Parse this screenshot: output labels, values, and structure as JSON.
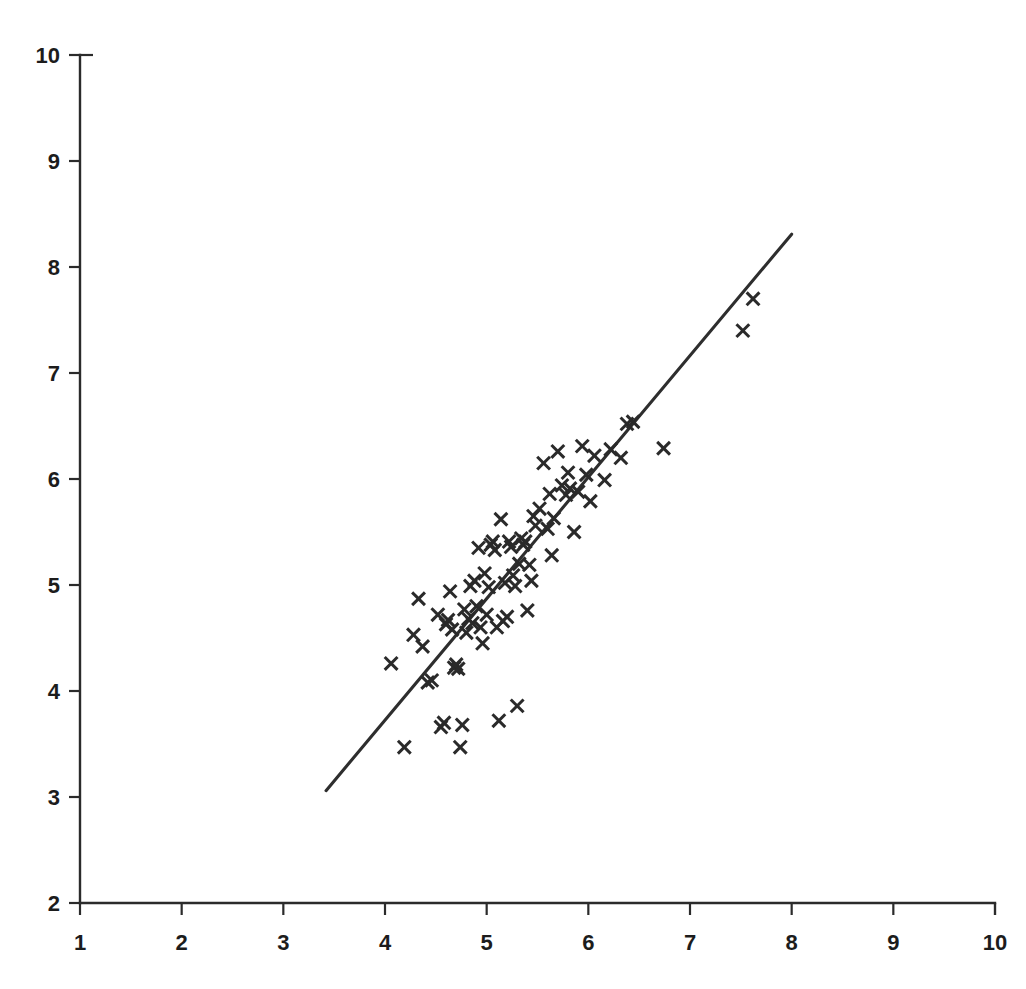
{
  "chart_data": {
    "type": "scatter",
    "title": "",
    "subtitle": "",
    "xlabel": "",
    "ylabel": "",
    "xlim": [
      1,
      10
    ],
    "ylim": [
      2,
      10
    ],
    "xticks": [
      1,
      2,
      3,
      4,
      5,
      6,
      7,
      8,
      9,
      10
    ],
    "yticks": [
      2,
      3,
      4,
      5,
      6,
      7,
      8,
      9,
      10
    ],
    "xtick_labels": [
      "1",
      "2",
      "3",
      "4",
      "5",
      "6",
      "7",
      "8",
      "9",
      "10"
    ],
    "ytick_labels": [
      "2",
      "3",
      "4",
      "5",
      "6",
      "7",
      "8",
      "9",
      "10"
    ],
    "grid": false,
    "legend": null,
    "marker": "x",
    "marker_color": "#2a2a2a",
    "line_color": "#2e2e2e",
    "axis_color": "#2b2b2b",
    "background_color": "#ffffff",
    "annotations": [],
    "series": [
      {
        "name": "observations",
        "type": "scatter",
        "points": [
          [
            4.06,
            4.26
          ],
          [
            4.19,
            3.47
          ],
          [
            4.28,
            4.53
          ],
          [
            4.33,
            4.87
          ],
          [
            4.37,
            4.42
          ],
          [
            4.42,
            4.08
          ],
          [
            4.46,
            4.1
          ],
          [
            4.52,
            4.72
          ],
          [
            4.55,
            3.66
          ],
          [
            4.58,
            3.7
          ],
          [
            4.6,
            4.63
          ],
          [
            4.62,
            4.67
          ],
          [
            4.64,
            4.94
          ],
          [
            4.66,
            4.58
          ],
          [
            4.68,
            4.22
          ],
          [
            4.7,
            4.25
          ],
          [
            4.72,
            4.21
          ],
          [
            4.74,
            3.47
          ],
          [
            4.76,
            3.68
          ],
          [
            4.78,
            4.77
          ],
          [
            4.8,
            4.55
          ],
          [
            4.82,
            4.68
          ],
          [
            4.84,
            4.99
          ],
          [
            4.86,
            4.64
          ],
          [
            4.88,
            5.04
          ],
          [
            4.9,
            4.8
          ],
          [
            4.92,
            5.35
          ],
          [
            4.94,
            4.6
          ],
          [
            4.96,
            4.45
          ],
          [
            4.98,
            5.11
          ],
          [
            5.0,
            4.72
          ],
          [
            5.02,
            4.98
          ],
          [
            5.04,
            5.38
          ],
          [
            5.06,
            5.41
          ],
          [
            5.08,
            5.33
          ],
          [
            5.1,
            4.6
          ],
          [
            5.12,
            3.72
          ],
          [
            5.14,
            5.62
          ],
          [
            5.16,
            4.66
          ],
          [
            5.18,
            5.02
          ],
          [
            5.2,
            4.7
          ],
          [
            5.22,
            5.41
          ],
          [
            5.24,
            5.36
          ],
          [
            5.26,
            5.09
          ],
          [
            5.28,
            4.99
          ],
          [
            5.3,
            3.86
          ],
          [
            5.32,
            5.2
          ],
          [
            5.34,
            5.44
          ],
          [
            5.36,
            5.38
          ],
          [
            5.38,
            5.41
          ],
          [
            5.4,
            4.76
          ],
          [
            5.42,
            5.19
          ],
          [
            5.44,
            5.04
          ],
          [
            5.46,
            5.65
          ],
          [
            5.48,
            5.56
          ],
          [
            5.52,
            5.72
          ],
          [
            5.56,
            6.15
          ],
          [
            5.6,
            5.53
          ],
          [
            5.62,
            5.86
          ],
          [
            5.64,
            5.28
          ],
          [
            5.66,
            5.63
          ],
          [
            5.7,
            6.26
          ],
          [
            5.74,
            5.94
          ],
          [
            5.78,
            5.85
          ],
          [
            5.8,
            6.06
          ],
          [
            5.82,
            5.91
          ],
          [
            5.86,
            5.5
          ],
          [
            5.9,
            5.88
          ],
          [
            5.94,
            6.31
          ],
          [
            5.98,
            6.04
          ],
          [
            6.02,
            5.79
          ],
          [
            6.06,
            6.22
          ],
          [
            6.16,
            5.99
          ],
          [
            6.22,
            6.28
          ],
          [
            6.32,
            6.2
          ],
          [
            6.38,
            6.52
          ],
          [
            6.44,
            6.54
          ],
          [
            6.74,
            6.29
          ],
          [
            7.52,
            7.4
          ],
          [
            7.62,
            7.7
          ]
        ]
      },
      {
        "name": "fit-line",
        "type": "line",
        "endpoints": [
          [
            3.42,
            3.06
          ],
          [
            8.0,
            8.31
          ]
        ]
      }
    ]
  }
}
